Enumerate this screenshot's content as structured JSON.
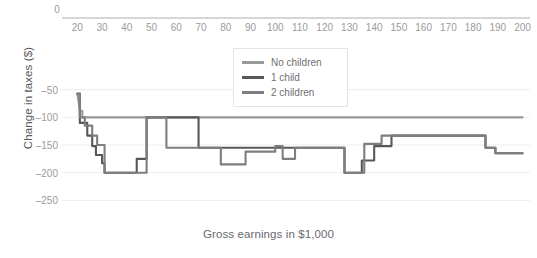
{
  "chart_data": {
    "type": "line",
    "title": "",
    "xlabel": "Gross earnings in $1,000",
    "ylabel": "Change in taxes ($)",
    "xlim": [
      15,
      203
    ],
    "ylim": [
      -262,
      0
    ],
    "xticks": [
      20,
      30,
      40,
      50,
      60,
      70,
      80,
      90,
      100,
      110,
      120,
      130,
      140,
      150,
      160,
      170,
      180,
      190,
      200
    ],
    "yticks": [
      -50,
      -100,
      -150,
      -200,
      -250
    ],
    "zero_tick_label": "0",
    "grid": true,
    "xaxis_position": "top",
    "legend_position": "upper center",
    "series": [
      {
        "name": "No children",
        "color": "#9a9a9c",
        "x": [
          20,
          20.5,
          21,
          22,
          22,
          23,
          200
        ],
        "values": [
          -58,
          -72,
          -88,
          -88,
          -100,
          -100,
          -100
        ]
      },
      {
        "name": "1 child",
        "color": "#58585a",
        "x": [
          20,
          21,
          21,
          24,
          24,
          26,
          26,
          27.5,
          27.5,
          30,
          30,
          31,
          31,
          44,
          44,
          48,
          48,
          49,
          49,
          69,
          69,
          128,
          128,
          135,
          135,
          140,
          140,
          147,
          147,
          153,
          153,
          185,
          185,
          189,
          189,
          200
        ],
        "values": [
          -57,
          -57,
          -110,
          -110,
          -133,
          -133,
          -152,
          -152,
          -168,
          -168,
          -183,
          -183,
          -200,
          -200,
          -175,
          -175,
          -100,
          -100,
          -100,
          -100,
          -155,
          -155,
          -200,
          -200,
          -178,
          -178,
          -152,
          -152,
          -133,
          -133,
          -133,
          -133,
          -155,
          -155,
          -165,
          -165
        ]
      },
      {
        "name": "2 children",
        "color": "#7e7e80",
        "x": [
          20,
          21,
          21,
          23,
          23,
          26,
          26,
          28,
          28,
          31,
          31,
          41,
          41,
          48,
          48,
          56,
          56,
          78,
          78,
          88,
          88,
          100,
          100,
          103,
          103,
          108,
          108,
          128,
          128,
          136,
          136,
          143,
          143,
          152,
          152,
          185,
          185,
          189,
          189,
          200
        ],
        "values": [
          -58,
          -58,
          -100,
          -100,
          -115,
          -115,
          -133,
          -133,
          -150,
          -150,
          -200,
          -200,
          -200,
          -200,
          -100,
          -100,
          -155,
          -155,
          -185,
          -185,
          -162,
          -162,
          -152,
          -152,
          -175,
          -175,
          -155,
          -155,
          -200,
          -200,
          -148,
          -148,
          -133,
          -133,
          -133,
          -133,
          -155,
          -155,
          -165,
          -165
        ]
      }
    ]
  },
  "legend": {
    "items": [
      {
        "label": "No children",
        "color": "#9a9a9c"
      },
      {
        "label": "1 child",
        "color": "#58585a"
      },
      {
        "label": "2 children",
        "color": "#7e7e80"
      }
    ]
  }
}
